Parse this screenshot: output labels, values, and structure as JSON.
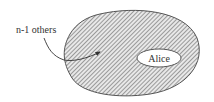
{
  "diagram": {
    "outer_set": {
      "label": "n-1 others",
      "fill_pattern": "diagonal-hatch",
      "stroke_color": "#555555"
    },
    "inner_set": {
      "label": "Alice",
      "fill_color": "#ffffff",
      "stroke_color": "#555555"
    },
    "arrow": {
      "from": "n-1 others label",
      "to": "outer_set"
    }
  }
}
